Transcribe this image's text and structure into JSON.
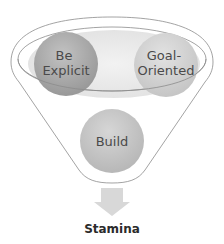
{
  "diagram": {
    "type": "funnel",
    "inputs": [
      {
        "label_lines": [
          "Be",
          "Explicit"
        ],
        "color": "#a8a8a8"
      },
      {
        "label_lines": [
          "Goal-",
          "Oriented"
        ],
        "color": "#d0d0d0"
      }
    ],
    "process": {
      "label": "Build",
      "color": "#c4c4c4"
    },
    "output": {
      "label": "Stamina",
      "arrow_color": "#d8d8d8"
    },
    "colors": {
      "funnel_stroke": "#8c8c8c",
      "tray_fill": "#ececec",
      "text": "#4a4a4a"
    }
  }
}
